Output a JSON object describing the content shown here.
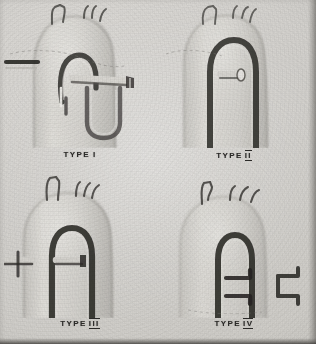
{
  "plate": {
    "kind": "anatomical-specimen-photograph",
    "subject": "aortic arch anomaly classification models",
    "background_color": "#d6d4d0",
    "ink_color": "#3a3835",
    "label_color": "#2c2b29"
  },
  "panels": [
    {
      "id": "type-1",
      "caption_word": "TYPE",
      "caption_numeral": "I",
      "numeral_overlined": false,
      "figure_name": "aortic-arch-model-type-1",
      "description": "Aortic arch model with three brachiocephalic branch vessels, descending aorta and a large low-lying vessel loop"
    },
    {
      "id": "type-2",
      "caption_word": "TYPE",
      "caption_numeral": "II",
      "numeral_overlined": true,
      "figure_name": "aortic-arch-model-type-2",
      "description": "Aortic arch model with narrow inner arch and single left-sided stub vessel"
    },
    {
      "id": "type-3",
      "caption_word": "TYPE",
      "caption_numeral": "III",
      "numeral_overlined": true,
      "figure_name": "aortic-arch-model-type-3",
      "description": "Aortic arch model with broad arch, two branch vessels and opposed lateral stubs"
    },
    {
      "id": "type-4",
      "caption_word": "TYPE",
      "caption_numeral": "IV",
      "numeral_overlined": true,
      "figure_name": "aortic-arch-model-type-4",
      "description": "Aortic arch model with short arch and two pairs of stepped lateral branch stubs"
    }
  ]
}
